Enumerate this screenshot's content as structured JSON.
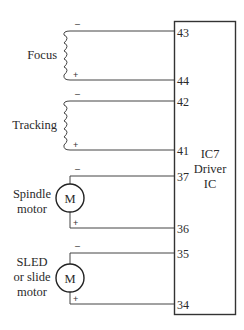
{
  "ic": {
    "line1": "IC7",
    "line2": "Driver",
    "line3": "IC"
  },
  "components": [
    {
      "name": "focus-coil",
      "label": [
        "Focus"
      ],
      "type": "coil",
      "minus_pin": "43",
      "plus_pin": "44"
    },
    {
      "name": "tracking-coil",
      "label": [
        "Tracking"
      ],
      "type": "coil",
      "minus_pin": "42",
      "plus_pin": "41"
    },
    {
      "name": "spindle-motor",
      "label": [
        "Spindle",
        "motor"
      ],
      "type": "motor",
      "symbol": "M",
      "minus_pin": "37",
      "plus_pin": "36"
    },
    {
      "name": "sled-motor",
      "label": [
        "SLED",
        "or slide",
        "motor"
      ],
      "type": "motor",
      "symbol": "M",
      "minus_pin": "35",
      "plus_pin": "34"
    }
  ],
  "polarity": {
    "minus": "–",
    "plus": "+"
  },
  "colors": {
    "line": "#444444",
    "box": "#333333",
    "background": "#ffffff"
  }
}
